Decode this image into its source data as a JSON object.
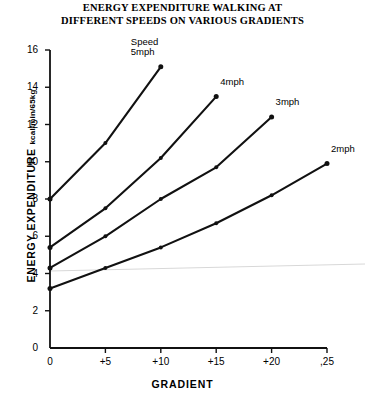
{
  "chart_data": {
    "type": "line",
    "title": "ENERGY EXPENDITURE WALKING AT DIFFERENT SPEEDS ON VARIOUS GRADIENTS",
    "title_lines": [
      "ENERGY EXPENDITURE WALKING AT",
      "DIFFERENT SPEEDS ON VARIOUS GRADIENTS"
    ],
    "xlabel": "GRADIENT",
    "ylabel": "ENERGY EXPENDITURE",
    "yunit": "kcal/min/65kg",
    "xlim": [
      0,
      25
    ],
    "ylim": [
      0,
      16
    ],
    "xticks": [
      0,
      5,
      10,
      15,
      20,
      25
    ],
    "xtick_labels": [
      "0",
      "+5",
      "+10",
      "+15",
      "+20",
      ",25"
    ],
    "yticks": [
      0,
      2,
      4,
      6,
      8,
      10,
      12,
      14,
      16
    ],
    "ytick_labels": [
      "0",
      "2",
      "4",
      "6",
      "8",
      "10",
      "12",
      "14",
      "16"
    ],
    "grid": false,
    "legend_position": "inline-end-of-line",
    "line_color": "#111111",
    "marker": "dot",
    "series": [
      {
        "name": "5mph",
        "label_lines": [
          "Speed",
          "5mph"
        ],
        "x": [
          0,
          5,
          10
        ],
        "values": [
          8.0,
          11.0,
          15.1
        ]
      },
      {
        "name": "4mph",
        "label_lines": [
          "4mph"
        ],
        "x": [
          0,
          5,
          10,
          15
        ],
        "values": [
          5.4,
          7.5,
          10.2,
          13.5
        ]
      },
      {
        "name": "3mph",
        "label_lines": [
          "3mph"
        ],
        "x": [
          0,
          5,
          10,
          15,
          20
        ],
        "values": [
          4.3,
          6.0,
          8.0,
          9.7,
          12.4
        ]
      },
      {
        "name": "2mph",
        "label_lines": [
          "2mph"
        ],
        "x": [
          0,
          5,
          10,
          15,
          20,
          25
        ],
        "values": [
          3.2,
          4.3,
          5.4,
          6.7,
          8.2,
          9.9
        ]
      }
    ]
  }
}
